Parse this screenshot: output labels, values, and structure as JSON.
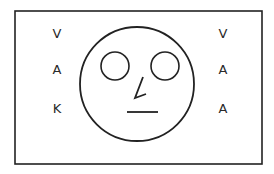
{
  "figure": {
    "frame": {
      "x": 15,
      "y": 11,
      "width": 247,
      "height": 153,
      "stroke": "#222222"
    },
    "face": {
      "outline": {
        "cx": 137,
        "cy": 84,
        "r": 57
      },
      "left_eye": {
        "cx": 115,
        "cy": 66,
        "r": 14
      },
      "right_eye": {
        "cx": 165,
        "cy": 66,
        "r": 14
      },
      "nose_points": "143,77 135,98 146,94",
      "mouth": {
        "x1": 127,
        "y1": 112,
        "x2": 158,
        "y2": 112
      }
    },
    "left_letters": [
      {
        "text": "V",
        "x": 57,
        "y": 38
      },
      {
        "text": "A",
        "x": 57,
        "y": 74
      },
      {
        "text": "K",
        "x": 57,
        "y": 113
      }
    ],
    "right_letters": [
      {
        "text": "V",
        "x": 223,
        "y": 38
      },
      {
        "text": "A",
        "x": 223,
        "y": 74
      },
      {
        "text": "A",
        "x": 223,
        "y": 113
      }
    ]
  }
}
